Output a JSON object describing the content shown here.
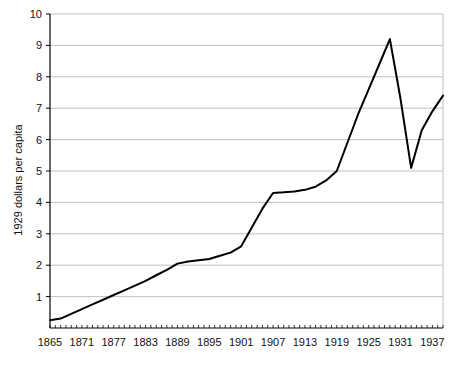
{
  "chart_data": {
    "type": "line",
    "title": "",
    "xlabel": "",
    "ylabel": "1929 dollars per capita",
    "xlim": [
      1865,
      1939
    ],
    "ylim": [
      0,
      10
    ],
    "grid": true,
    "grid_axis": "y",
    "legend": false,
    "legend_position": "none",
    "line_color": "#000000",
    "grid_color": "#bfbfbf",
    "axis_color": "#000000",
    "background_color": "#ffffff",
    "xticks": [
      1865,
      1871,
      1877,
      1883,
      1889,
      1895,
      1901,
      1907,
      1913,
      1919,
      1925,
      1931,
      1937
    ],
    "xtick_labels": [
      "1865",
      "1871",
      "1877",
      "1883",
      "1889",
      "1895",
      "1901",
      "1907",
      "1913",
      "1919",
      "1925",
      "1931",
      "1937"
    ],
    "xminor_tick_interval": 1,
    "yticks": [
      0,
      1,
      2,
      3,
      4,
      5,
      6,
      7,
      8,
      9,
      10
    ],
    "ytick_labels": [
      "",
      "1",
      "2",
      "3",
      "4",
      "5",
      "6",
      "7",
      "8",
      "9",
      "10"
    ],
    "series": [
      {
        "name": "1929 dollars per capita",
        "x": [
          1865,
          1867,
          1869,
          1871,
          1873,
          1875,
          1877,
          1879,
          1881,
          1883,
          1885,
          1887,
          1889,
          1891,
          1893,
          1895,
          1897,
          1899,
          1901,
          1903,
          1905,
          1907,
          1909,
          1911,
          1913,
          1915,
          1917,
          1919,
          1921,
          1923,
          1925,
          1927,
          1929,
          1931,
          1933,
          1935,
          1937,
          1939
        ],
        "values": [
          0.25,
          0.3,
          0.45,
          0.6,
          0.75,
          0.9,
          1.05,
          1.2,
          1.35,
          1.5,
          1.68,
          1.85,
          2.05,
          2.12,
          2.16,
          2.2,
          2.3,
          2.4,
          2.6,
          3.2,
          3.8,
          4.3,
          4.32,
          4.35,
          4.4,
          4.5,
          4.7,
          5.0,
          5.9,
          6.8,
          7.6,
          8.4,
          9.2,
          7.3,
          5.1,
          6.3,
          6.9,
          7.4
        ]
      }
    ],
    "annotations": [
      {
        "label": "peak",
        "x": 1929,
        "y": 9.2
      },
      {
        "label": "trough",
        "x": 1933,
        "y": 5.1
      },
      {
        "label": "end",
        "x": 1939,
        "y": 7.4
      }
    ]
  }
}
